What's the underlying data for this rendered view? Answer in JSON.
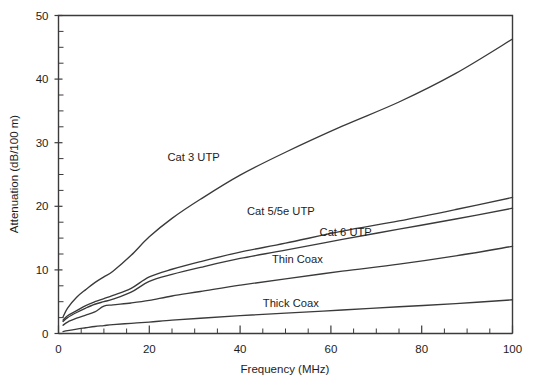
{
  "chart_data": {
    "type": "line",
    "title": "",
    "xlabel": "Frequency (MHz)",
    "ylabel": "Attenuation (dB/100 m)",
    "xlim": [
      0,
      100
    ],
    "ylim": [
      0,
      50
    ],
    "grid": false,
    "legend_position": "inline-labels",
    "x_ticks_major": [
      0,
      20,
      40,
      60,
      80,
      100
    ],
    "x_ticks_major_labels": [
      "0",
      "20",
      "40",
      "60",
      "80",
      "100"
    ],
    "x_tick_minor_step": 5,
    "y_ticks_major": [
      0,
      10,
      20,
      30,
      40,
      50
    ],
    "y_ticks_major_labels": [
      "0",
      "10",
      "20",
      "30",
      "40",
      "50"
    ],
    "y_tick_minor_step": 2.5,
    "x": [
      1,
      2,
      4,
      6,
      8,
      10,
      12,
      16,
      20,
      25,
      31.25,
      40,
      50,
      62.5,
      75,
      87.5,
      100
    ],
    "series": [
      {
        "name": "Cat 3 UTP",
        "label": "Cat 3 UTP",
        "color": "#3a3a3a",
        "label_x": 24,
        "label_y": 27.2,
        "values": [
          2.6,
          4.0,
          5.7,
          6.9,
          8.0,
          8.9,
          9.8,
          12.3,
          15.2,
          18.1,
          21.1,
          24.9,
          28.5,
          32.6,
          36.4,
          40.9,
          46.3
        ]
      },
      {
        "name": "Cat 5/5e UTP",
        "label": "Cat 5/5e UTP",
        "color": "#3a3a3a",
        "label_x": 41.5,
        "label_y": 18.6,
        "values": [
          2.1,
          2.8,
          3.6,
          4.4,
          5.0,
          5.5,
          6.0,
          7.1,
          8.9,
          10.1,
          11.3,
          12.8,
          14.2,
          16.1,
          17.7,
          19.5,
          21.4
        ]
      },
      {
        "name": "Cat 6 UTP",
        "label": "Cat 6 UTP",
        "color": "#3a3a3a",
        "label_x": 57.5,
        "label_y": 15.3,
        "values": [
          1.9,
          2.5,
          3.3,
          4.0,
          4.6,
          5.0,
          5.4,
          6.5,
          8.2,
          9.3,
          10.4,
          11.8,
          13.1,
          14.8,
          16.4,
          18.0,
          19.7
        ]
      },
      {
        "name": "Thin Coax",
        "label": "Thin Coax",
        "color": "#3a3a3a",
        "label_x": 47,
        "label_y": 11.1,
        "values": [
          1.3,
          1.8,
          2.4,
          2.9,
          3.4,
          4.3,
          4.5,
          4.8,
          5.2,
          5.9,
          6.6,
          7.6,
          8.6,
          9.8,
          10.9,
          12.2,
          13.7
        ]
      },
      {
        "name": "Thick Coax",
        "label": "Thick Coax",
        "color": "#3a3a3a",
        "label_x": 45,
        "label_y": 4.2,
        "values": [
          0.3,
          0.45,
          0.7,
          0.9,
          1.1,
          1.25,
          1.4,
          1.6,
          1.8,
          2.1,
          2.4,
          2.8,
          3.2,
          3.7,
          4.2,
          4.7,
          5.3
        ]
      }
    ]
  },
  "figure": {
    "background_color": "#ffffff",
    "axis_color": "#3b3b3b",
    "text_color": "#1d1d1d"
  }
}
